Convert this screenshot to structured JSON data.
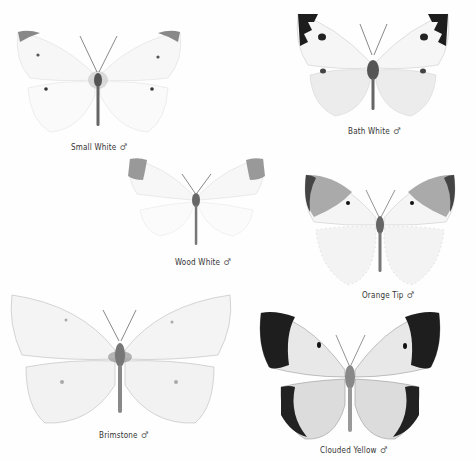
{
  "plate": {
    "specimens": [
      {
        "name": "Small White",
        "sex_symbol": "♂"
      },
      {
        "name": "Bath White",
        "sex_symbol": "♂"
      },
      {
        "name": "Wood White",
        "sex_symbol": "♂"
      },
      {
        "name": "Orange Tip",
        "sex_symbol": "♂"
      },
      {
        "name": "Brimstone",
        "sex_symbol": "♂"
      },
      {
        "name": "Clouded Yellow",
        "sex_symbol": "♂"
      }
    ]
  }
}
